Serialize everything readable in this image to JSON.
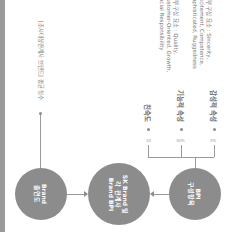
{
  "diagram": {
    "orientation": "rotated 90deg clockwise",
    "colors": {
      "circle": "#8c8c8c",
      "line": "#9a9a9a",
      "bar": "#9a9a9a"
    },
    "nodes": [
      {
        "id": "brand-awareness",
        "label": "Brand\n출연도"
      },
      {
        "id": "sk-brand-bpi",
        "label": "SK Brand 및\n각 관계사\nBrand BPI"
      },
      {
        "id": "bpi-components",
        "label": "BPI\n구성항목"
      }
    ],
    "top_note": "[조사대상관계사 브랜드] 평균 점수",
    "components": [
      {
        "label": "친숙도",
        "pct": "10",
        "desc": ""
      },
      {
        "label": "기능적 속성",
        "pct": "30%",
        "desc": "세부 구성 요소 : Quality,\nCustomer-Oriented, Growth,\nSocial Responsibility"
      },
      {
        "label": "감성적 속성",
        "pct": "3%",
        "desc": "세부 구성 요소 : Sincerity,\nExcitement, Competence,\nSophisticated, Ruggedness"
      }
    ]
  }
}
